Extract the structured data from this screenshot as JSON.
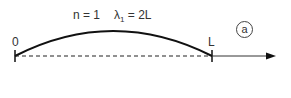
{
  "diagram": {
    "mode_label": "n = 1",
    "wavelength_symbol": "λ",
    "wavelength_subscript": "1",
    "wavelength_value": "= 2L",
    "left_end_label": "0",
    "right_end_label": "L",
    "panel_label": "a",
    "colors": {
      "stroke": "#111111",
      "text": "#333333",
      "background": "#ffffff"
    }
  }
}
